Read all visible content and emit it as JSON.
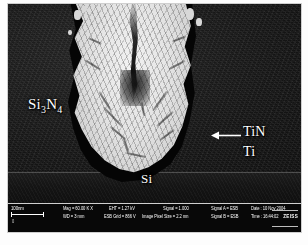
{
  "figure": {
    "type": "sem-cross-section-micrograph",
    "caption": ""
  },
  "annotations": {
    "dielectric": "Si",
    "dielectric_sub1": "3",
    "dielectric_mid": "N",
    "dielectric_sub2": "4",
    "tin": "TiN",
    "ti": "Ti",
    "si": "Si",
    "arrow": "arrow-left-pointing"
  },
  "databar": {
    "scale": {
      "length_label": "100nm",
      "tick_label": "0"
    },
    "fields": [
      {
        "label": "Mag =",
        "value": "60.00 K X"
      },
      {
        "label": "WD =",
        "value": "3 mm"
      },
      {
        "label": "EHT =",
        "value": "1.27 kV"
      },
      {
        "label": "ESB Grid =",
        "value": "866 V"
      },
      {
        "label": "Image Pixel Size =",
        "value": "2.2 nm"
      },
      {
        "label": "Signal =",
        "value": "1.000"
      },
      {
        "label": "Signal A =",
        "value": "ESB"
      },
      {
        "label": "Signal B =",
        "value": "ESB"
      },
      {
        "label": "Date :",
        "value": "10 Nov 2004"
      },
      {
        "label": "Time :",
        "value": "16:44:02"
      }
    ],
    "filename_label": "File Name =",
    "filename_value": "Section-18.tif",
    "logo": "ZEISS"
  },
  "colors": {
    "background": "#ffffff",
    "film": "#181818",
    "substrate": "#141414",
    "plug": "#e6e6e6",
    "liner": "#050505",
    "label_text": "#ffffff",
    "databar_bg": "#080808"
  }
}
